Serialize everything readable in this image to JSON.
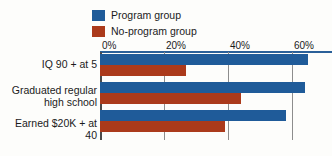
{
  "chart_data": {
    "type": "bar",
    "orientation": "horizontal",
    "title": "",
    "xlabel": "",
    "ylabel": "",
    "categories": [
      "IQ 90 + at 5",
      "Graduated regular high school",
      "Earned $20K + at 40"
    ],
    "series": [
      {
        "name": "Program group",
        "color": "#1f5b99",
        "values": [
          65,
          64,
          58
        ]
      },
      {
        "name": "No-program group",
        "color": "#ab3a1b",
        "values": [
          27,
          44,
          39
        ]
      }
    ],
    "xlim": [
      0,
      70
    ],
    "xticks": [
      0,
      20,
      40,
      60
    ],
    "xtick_labels": [
      "0%",
      "20%",
      "40%",
      "60%"
    ],
    "grid": true,
    "legend_position": "top"
  },
  "legend": {
    "items": [
      {
        "label": "Program group",
        "swatch_name": "legend-swatch-program",
        "color": "#1f5b99"
      },
      {
        "label": "No-program group",
        "swatch_name": "legend-swatch-no-program",
        "color": "#ab3a1b"
      }
    ]
  },
  "axis": {
    "ticks": [
      {
        "label": "0%",
        "value": 0
      },
      {
        "label": "20%",
        "value": 20
      },
      {
        "label": "40%",
        "value": 40
      },
      {
        "label": "60%",
        "value": 60
      }
    ]
  },
  "categories": [
    {
      "line1": "IQ 90 + at 5",
      "line2": ""
    },
    {
      "line1": "Graduated regular",
      "line2": "high school"
    },
    {
      "line1": "Earned $20K + at 40",
      "line2": ""
    }
  ],
  "colors": {
    "program": "#1f5b99",
    "no_program": "#ab3a1b",
    "gridline": "#8d8d8d",
    "axis": "#2a6099",
    "background": "#fdfdfb"
  }
}
